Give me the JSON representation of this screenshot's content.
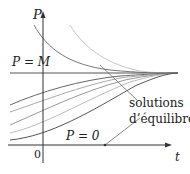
{
  "diagram": {
    "axis_y_label": "P",
    "axis_x_label": "t",
    "origin_label": "0",
    "line_upper_label": "P = M",
    "line_lower_label": "P = 0",
    "annotation_line1": "solutions",
    "annotation_line2": "d’équilibre",
    "colors": {
      "axis": "#333333",
      "curve_dark": "#555555",
      "curve_mid": "#888888",
      "curve_light": "#bbbbbb"
    }
  }
}
